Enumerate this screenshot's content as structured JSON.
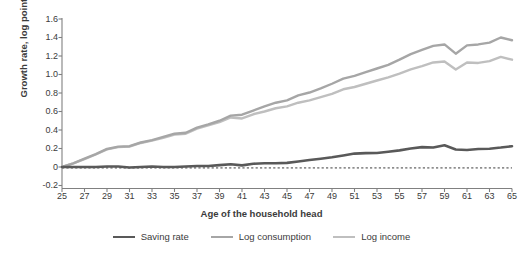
{
  "chart_data": {
    "type": "line",
    "title": "",
    "xlabel": "Age of the household head",
    "ylabel": "Growth rate, log points",
    "xlim": [
      25,
      65
    ],
    "ylim": [
      -0.2,
      1.6
    ],
    "ytick_labels": [
      "1.6",
      "1.4",
      "1.2",
      "1.0",
      "0.8",
      "0.6",
      "0.4",
      "0.2",
      "0",
      "-0.2"
    ],
    "ytick_values": [
      1.6,
      1.4,
      1.2,
      1.0,
      0.8,
      0.6,
      0.4,
      0.2,
      0,
      -0.2
    ],
    "xtick_labels": [
      "25",
      "27",
      "29",
      "31",
      "33",
      "35",
      "37",
      "39",
      "41",
      "43",
      "45",
      "47",
      "49",
      "51",
      "53",
      "55",
      "57",
      "59",
      "61",
      "63",
      "65"
    ],
    "xtick_values": [
      25,
      27,
      29,
      31,
      33,
      35,
      37,
      39,
      41,
      43,
      45,
      47,
      49,
      51,
      53,
      55,
      57,
      59,
      61,
      63,
      65
    ],
    "grid": false,
    "legend_position": "bottom",
    "reference_line": {
      "y": -0.01,
      "style": "dashed",
      "color": "#3b3b3b"
    },
    "x": [
      25,
      26,
      27,
      28,
      29,
      30,
      31,
      32,
      33,
      34,
      35,
      36,
      37,
      38,
      39,
      40,
      41,
      42,
      43,
      44,
      45,
      46,
      47,
      48,
      49,
      50,
      51,
      52,
      53,
      54,
      55,
      56,
      57,
      58,
      59,
      60,
      61,
      62,
      63,
      64,
      65
    ],
    "series": [
      {
        "name": "Saving rate",
        "color": "#595959",
        "width": 2.6,
        "values": [
          0.0,
          0.0,
          0.0,
          0.0,
          0.005,
          0.005,
          -0.005,
          0.0,
          0.005,
          0.0,
          0.0,
          0.005,
          0.01,
          0.01,
          0.02,
          0.03,
          0.018,
          0.035,
          0.04,
          0.04,
          0.045,
          0.06,
          0.075,
          0.09,
          0.105,
          0.125,
          0.145,
          0.15,
          0.152,
          0.165,
          0.18,
          0.2,
          0.215,
          0.21,
          0.235,
          0.19,
          0.183,
          0.195,
          0.198,
          0.21,
          0.225
        ]
      },
      {
        "name": "Log consumption",
        "color": "#a6a6a6",
        "width": 2.4,
        "values": [
          0.0,
          0.04,
          0.09,
          0.14,
          0.195,
          0.22,
          0.225,
          0.265,
          0.29,
          0.325,
          0.36,
          0.37,
          0.425,
          0.46,
          0.5,
          0.555,
          0.565,
          0.61,
          0.655,
          0.695,
          0.72,
          0.775,
          0.805,
          0.85,
          0.9,
          0.955,
          0.985,
          1.025,
          1.065,
          1.105,
          1.16,
          1.22,
          1.265,
          1.31,
          1.325,
          1.225,
          1.315,
          1.325,
          1.345,
          1.4,
          1.37
        ]
      },
      {
        "name": "Log income",
        "color": "#bfbfbf",
        "width": 2.4,
        "values": [
          0.0,
          0.04,
          0.085,
          0.135,
          0.19,
          0.215,
          0.22,
          0.26,
          0.285,
          0.315,
          0.35,
          0.36,
          0.415,
          0.45,
          0.485,
          0.535,
          0.525,
          0.57,
          0.6,
          0.635,
          0.655,
          0.695,
          0.72,
          0.755,
          0.79,
          0.84,
          0.865,
          0.9,
          0.935,
          0.97,
          1.01,
          1.055,
          1.09,
          1.13,
          1.14,
          1.055,
          1.13,
          1.125,
          1.145,
          1.19,
          1.16
        ]
      }
    ]
  },
  "legend": {
    "items": [
      {
        "label": "Saving rate",
        "color": "#595959",
        "thickness": "2.6px"
      },
      {
        "label": "Log consumption",
        "color": "#a6a6a6",
        "thickness": "2.4px"
      },
      {
        "label": "Log income",
        "color": "#bfbfbf",
        "thickness": "2.4px"
      }
    ]
  },
  "axes": {
    "y_title": "Growth rate, log points",
    "x_title": "Age of the household head",
    "axis_color": "#808080"
  }
}
